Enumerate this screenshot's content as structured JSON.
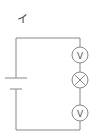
{
  "diagram": {
    "label": "イ",
    "type": "circuit",
    "components": [
      {
        "kind": "battery",
        "symbol": "cell"
      },
      {
        "kind": "voltmeter",
        "symbol": "V",
        "position": "top-right"
      },
      {
        "kind": "lamp",
        "symbol": "⊗",
        "position": "middle-right"
      },
      {
        "kind": "voltmeter",
        "symbol": "V",
        "position": "bottom-right"
      }
    ],
    "colors": {
      "wire": "#888888",
      "background": "#ffffff"
    }
  }
}
